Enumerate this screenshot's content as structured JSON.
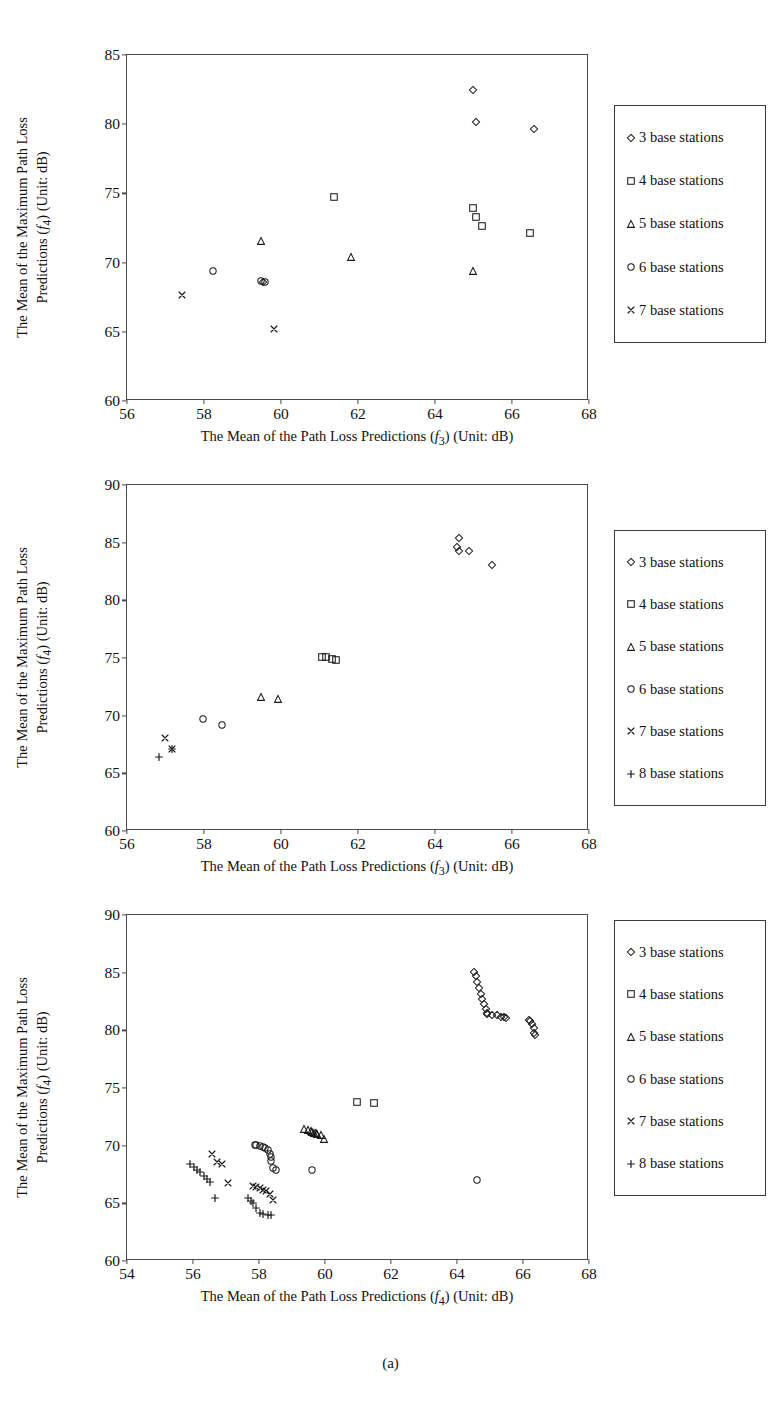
{
  "figure": {
    "caption": "(a)"
  },
  "chart_data": [
    {
      "type": "scatter",
      "title": "",
      "xlabel": "The Mean of the Path Loss Predictions (f3) (Unit: dB)",
      "xlabel_parts": {
        "pre": "The Mean of the Path Loss Predictions (",
        "var": "f",
        "sub": "3",
        "post": ") (Unit: dB)"
      },
      "ylabel": "The Mean of the Maximum Path Loss Predictions (f4) (Unit: dB)",
      "ylabel_line1": "The Mean of the Maximum Path Loss",
      "ylabel_line2_pre": "Predictions (",
      "ylabel_line2_var": "f",
      "ylabel_line2_sub": "4",
      "ylabel_line2_post": ") (Unit: dB)",
      "xlim": [
        56,
        68
      ],
      "ylim": [
        60,
        85
      ],
      "xticks": [
        56,
        58,
        60,
        62,
        64,
        66,
        68
      ],
      "yticks": [
        60,
        65,
        70,
        75,
        80,
        85
      ],
      "grid": false,
      "legend_position": "right-outside",
      "series": [
        {
          "name": "3 base stations",
          "marker": "diamond",
          "points": [
            [
              65.0,
              82.4
            ],
            [
              65.1,
              80.1
            ],
            [
              66.6,
              79.6
            ],
            [
              59.55,
              68.5
            ]
          ]
        },
        {
          "name": "4 base stations",
          "marker": "square",
          "points": [
            [
              61.4,
              74.7
            ],
            [
              65.0,
              73.9
            ],
            [
              65.1,
              73.2
            ],
            [
              65.25,
              72.6
            ],
            [
              66.5,
              72.1
            ]
          ]
        },
        {
          "name": "5 base stations",
          "marker": "triangle",
          "points": [
            [
              59.5,
              71.5
            ],
            [
              61.85,
              70.3
            ],
            [
              65.0,
              69.3
            ]
          ]
        },
        {
          "name": "6 base stations",
          "marker": "circle",
          "points": [
            [
              58.25,
              69.35
            ],
            [
              59.5,
              68.6
            ],
            [
              59.6,
              68.5
            ]
          ]
        },
        {
          "name": "7 base stations",
          "marker": "cross",
          "points": [
            [
              57.45,
              67.6
            ],
            [
              59.85,
              65.1
            ]
          ]
        }
      ]
    },
    {
      "type": "scatter",
      "title": "",
      "xlabel": "The Mean of the Path Loss Predictions (f3) (Unit: dB)",
      "xlabel_parts": {
        "pre": "The Mean of the Path Loss Predictions (",
        "var": "f",
        "sub": "3",
        "post": ") (Unit: dB)"
      },
      "ylabel": "The Mean of the Maximum Path Loss Predictions (f4) (Unit: dB)",
      "ylabel_line1": "The Mean of the Maximum Path Loss",
      "ylabel_line2_pre": "Predictions (",
      "ylabel_line2_var": "f",
      "ylabel_line2_sub": "4",
      "ylabel_line2_post": ") (Unit: dB)",
      "xlim": [
        56,
        68
      ],
      "ylim": [
        60,
        90
      ],
      "xticks": [
        56,
        58,
        60,
        62,
        64,
        66,
        68
      ],
      "yticks": [
        60,
        65,
        70,
        75,
        80,
        85,
        90
      ],
      "grid": false,
      "legend_position": "right-outside",
      "series": [
        {
          "name": "3 base stations",
          "marker": "diamond",
          "points": [
            [
              64.65,
              85.3
            ],
            [
              64.6,
              84.5
            ],
            [
              64.65,
              84.2
            ],
            [
              64.9,
              84.2
            ],
            [
              65.5,
              83.0
            ]
          ]
        },
        {
          "name": "4 base stations",
          "marker": "square",
          "points": [
            [
              61.1,
              75.0
            ],
            [
              61.2,
              75.0
            ],
            [
              61.35,
              74.8
            ],
            [
              61.45,
              74.7
            ]
          ]
        },
        {
          "name": "5 base stations",
          "marker": "triangle",
          "points": [
            [
              59.5,
              71.5
            ],
            [
              59.95,
              71.4
            ]
          ]
        },
        {
          "name": "6 base stations",
          "marker": "circle",
          "points": [
            [
              58.0,
              69.6
            ],
            [
              58.5,
              69.1
            ]
          ]
        },
        {
          "name": "7 base stations",
          "marker": "cross",
          "points": [
            [
              57.0,
              68.0
            ],
            [
              57.2,
              67.0
            ]
          ]
        },
        {
          "name": "8 base stations",
          "marker": "plus",
          "points": [
            [
              56.85,
              66.3
            ],
            [
              57.2,
              67.0
            ]
          ]
        }
      ]
    },
    {
      "type": "scatter",
      "title": "",
      "xlabel": "The Mean of the Path Loss Predictions (f4) (Unit: dB)",
      "xlabel_parts": {
        "pre": "The Mean of the Path Loss Predictions (",
        "var": "f",
        "sub": "4",
        "post": ") (Unit: dB)"
      },
      "ylabel": "The Mean of the Maximum Path Loss Predictions (f4) (Unit: dB)",
      "ylabel_line1": "The Mean of the Maximum Path Loss",
      "ylabel_line2_pre": "Predictions (",
      "ylabel_line2_var": "f",
      "ylabel_line2_sub": "4",
      "ylabel_line2_post": ") (Unit: dB)",
      "xlim": [
        54,
        68
      ],
      "ylim": [
        60,
        90
      ],
      "xticks": [
        54,
        56,
        58,
        60,
        62,
        64,
        66,
        68
      ],
      "yticks": [
        60,
        65,
        70,
        75,
        80,
        85,
        90
      ],
      "grid": false,
      "legend_position": "right-outside",
      "series": [
        {
          "name": "3 base stations",
          "marker": "diamond",
          "points": [
            [
              64.55,
              85.0
            ],
            [
              64.6,
              84.6
            ],
            [
              64.65,
              84.1
            ],
            [
              64.7,
              83.6
            ],
            [
              64.75,
              83.1
            ],
            [
              64.8,
              82.6
            ],
            [
              64.85,
              82.2
            ],
            [
              64.9,
              81.8
            ],
            [
              64.95,
              81.4
            ],
            [
              64.95,
              81.3
            ],
            [
              65.1,
              81.2
            ],
            [
              65.25,
              81.2
            ],
            [
              65.35,
              81.1
            ],
            [
              65.45,
              81.1
            ],
            [
              65.5,
              81.0
            ],
            [
              66.2,
              80.8
            ],
            [
              66.25,
              80.7
            ],
            [
              66.3,
              80.5
            ],
            [
              66.35,
              80.1
            ],
            [
              66.35,
              79.7
            ],
            [
              66.4,
              79.5
            ]
          ]
        },
        {
          "name": "4 base stations",
          "marker": "square",
          "points": [
            [
              61.0,
              73.7
            ],
            [
              61.5,
              73.65
            ]
          ]
        },
        {
          "name": "5 base stations",
          "marker": "triangle",
          "points": [
            [
              59.4,
              71.4
            ],
            [
              59.5,
              71.3
            ],
            [
              59.6,
              71.2
            ],
            [
              59.65,
              71.1
            ],
            [
              59.7,
              71.05
            ],
            [
              59.75,
              71.0
            ],
            [
              59.8,
              70.9
            ],
            [
              59.9,
              70.8
            ],
            [
              60.0,
              70.5
            ]
          ]
        },
        {
          "name": "6 base stations",
          "marker": "circle",
          "points": [
            [
              57.9,
              70.0
            ],
            [
              57.95,
              69.95
            ],
            [
              58.05,
              69.9
            ],
            [
              58.15,
              69.8
            ],
            [
              58.2,
              69.7
            ],
            [
              58.3,
              69.5
            ],
            [
              58.35,
              69.2
            ],
            [
              58.4,
              68.9
            ],
            [
              58.4,
              68.6
            ],
            [
              58.45,
              68.0
            ],
            [
              58.55,
              67.8
            ],
            [
              59.65,
              67.8
            ],
            [
              64.65,
              66.9
            ]
          ]
        },
        {
          "name": "7 base stations",
          "marker": "cross",
          "points": [
            [
              56.6,
              69.2
            ],
            [
              56.75,
              68.5
            ],
            [
              56.9,
              68.3
            ],
            [
              57.1,
              66.7
            ],
            [
              57.85,
              66.4
            ],
            [
              57.95,
              66.3
            ],
            [
              58.05,
              66.2
            ],
            [
              58.15,
              66.1
            ],
            [
              58.25,
              66.0
            ],
            [
              58.35,
              65.7
            ],
            [
              58.45,
              65.2
            ]
          ]
        },
        {
          "name": "8 base stations",
          "marker": "plus",
          "points": [
            [
              55.95,
              68.3
            ],
            [
              56.05,
              68.1
            ],
            [
              56.15,
              67.8
            ],
            [
              56.25,
              67.6
            ],
            [
              56.35,
              67.3
            ],
            [
              56.45,
              67.0
            ],
            [
              56.55,
              66.8
            ],
            [
              56.7,
              65.4
            ],
            [
              57.7,
              65.4
            ],
            [
              57.8,
              65.1
            ],
            [
              57.85,
              64.9
            ],
            [
              57.95,
              64.5
            ],
            [
              58.05,
              64.1
            ],
            [
              58.15,
              64.0
            ],
            [
              58.3,
              63.9
            ],
            [
              58.4,
              63.9
            ]
          ]
        }
      ]
    }
  ],
  "legends": [
    {
      "items": [
        {
          "label": "3 base stations",
          "marker": "diamond"
        },
        {
          "label": "4 base stations",
          "marker": "square"
        },
        {
          "label": "5 base stations",
          "marker": "triangle"
        },
        {
          "label": "6 base stations",
          "marker": "circle"
        },
        {
          "label": "7 base stations",
          "marker": "cross"
        }
      ]
    },
    {
      "items": [
        {
          "label": "3 base stations",
          "marker": "diamond"
        },
        {
          "label": "4 base stations",
          "marker": "square"
        },
        {
          "label": "5 base stations",
          "marker": "triangle"
        },
        {
          "label": "6 base stations",
          "marker": "circle"
        },
        {
          "label": "7 base stations",
          "marker": "cross"
        },
        {
          "label": "8 base stations",
          "marker": "plus"
        }
      ]
    },
    {
      "items": [
        {
          "label": "3 base stations",
          "marker": "diamond"
        },
        {
          "label": "4 base stations",
          "marker": "square"
        },
        {
          "label": "5 base stations",
          "marker": "triangle"
        },
        {
          "label": "6 base stations",
          "marker": "circle"
        },
        {
          "label": "7 base stations",
          "marker": "cross"
        },
        {
          "label": "8 base stations",
          "marker": "plus"
        }
      ]
    }
  ],
  "colors": {
    "axis": "#4b4b4b",
    "marker": "#1a1a1a",
    "legend_border": "#3a3a3a",
    "text": "#111111",
    "background": "#ffffff"
  }
}
